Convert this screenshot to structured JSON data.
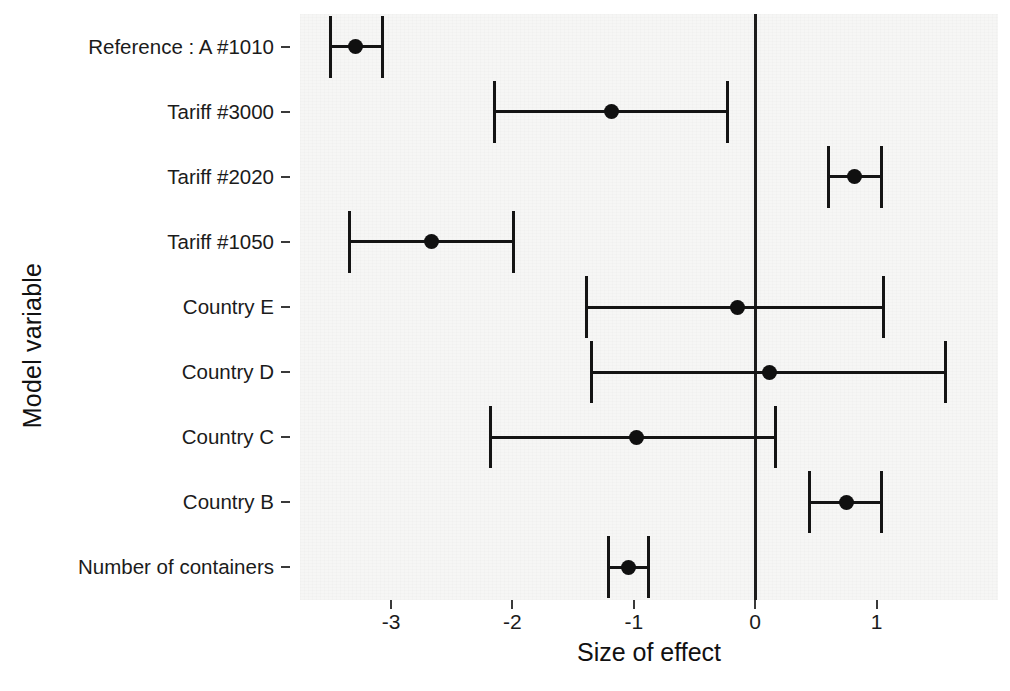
{
  "chart_data": {
    "type": "scatter",
    "subtype": "forest-plot",
    "title": "",
    "xlabel": "Size of effect",
    "ylabel": "Model variable",
    "xlim": [
      -3.75,
      2.0
    ],
    "xticks": [
      -3,
      -2,
      -1,
      0,
      1
    ],
    "xticklabels": [
      "-3",
      "-2",
      "-1",
      "0",
      "1"
    ],
    "grid": false,
    "legend": null,
    "reference_line_x": 0,
    "categories": [
      "Reference : A #1010",
      "Tariff  #3000",
      "Tariff  #2020",
      "Tariff  #1050",
      "Country E",
      "Country D",
      "Country C",
      "Country B",
      "Number of containers"
    ],
    "points": [
      {
        "label": "Reference : A #1010",
        "estimate": -3.29,
        "ci_low": -3.5,
        "ci_high": -3.07
      },
      {
        "label": "Tariff  #3000",
        "estimate": -1.18,
        "ci_low": -2.15,
        "ci_high": -0.23
      },
      {
        "label": "Tariff  #2020",
        "estimate": 0.82,
        "ci_low": 0.6,
        "ci_high": 1.04
      },
      {
        "label": "Tariff  #1050",
        "estimate": -2.67,
        "ci_low": -3.34,
        "ci_high": -1.99
      },
      {
        "label": "Country E",
        "estimate": -0.15,
        "ci_low": -1.39,
        "ci_high": 1.06
      },
      {
        "label": "Country D",
        "estimate": 0.12,
        "ci_low": -1.35,
        "ci_high": 1.57
      },
      {
        "label": "Country C",
        "estimate": -0.98,
        "ci_low": -2.18,
        "ci_high": 0.17
      },
      {
        "label": "Country B",
        "estimate": 0.75,
        "ci_low": 0.45,
        "ci_high": 1.04
      },
      {
        "label": "Number of containers",
        "estimate": -1.04,
        "ci_low": -1.21,
        "ci_high": -0.88
      }
    ]
  },
  "style": {
    "panel_background": "#f6f6f5",
    "figure_background": "#ffffff",
    "marker_color": "#101010",
    "line_color": "#141414",
    "axis_text_color": "#1b1b1b"
  }
}
